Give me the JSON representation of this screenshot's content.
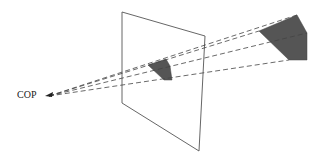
{
  "diagram": {
    "labels": {
      "cop": "COP"
    },
    "colors": {
      "stroke": "#555555",
      "dash": "#444444",
      "fill": "#555555",
      "background": "#ffffff"
    },
    "elements": [
      {
        "id": "cop",
        "kind": "point",
        "label": "COP",
        "position": [
          46,
          96
        ]
      },
      {
        "id": "view-plane",
        "kind": "plane",
        "corners": [
          [
            122,
            12
          ],
          [
            205,
            36
          ],
          [
            199,
            151
          ],
          [
            122,
            103
          ]
        ]
      },
      {
        "id": "projected-object",
        "kind": "filled-polygon",
        "points": [
          [
            148,
            65
          ],
          [
            166,
            59
          ],
          [
            170,
            66
          ],
          [
            172,
            80
          ],
          [
            164,
            80
          ]
        ]
      },
      {
        "id": "object",
        "kind": "filled-polygon",
        "points": [
          [
            259,
            31
          ],
          [
            297,
            15
          ],
          [
            307,
            33
          ],
          [
            307,
            60
          ],
          [
            289,
            60
          ]
        ]
      },
      {
        "id": "projectors",
        "kind": "dashed-lines",
        "from": "cop",
        "to": [
          [
            259,
            31
          ],
          [
            297,
            15
          ],
          [
            307,
            33
          ],
          [
            289,
            60
          ]
        ]
      }
    ]
  }
}
